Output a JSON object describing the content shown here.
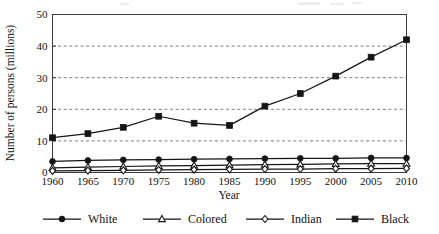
{
  "chart_data": {
    "type": "line",
    "title": "",
    "xlabel": "Year",
    "ylabel": "Number of persons (millions)",
    "x": [
      1960,
      1965,
      1970,
      1975,
      1980,
      1985,
      1990,
      1995,
      2000,
      2005,
      2010
    ],
    "xtick_labels": [
      "1960",
      "1965",
      "1970",
      "1975",
      "1980",
      "1985",
      "1990",
      "1995",
      "2000",
      "2005",
      "2010"
    ],
    "ytick_labels": [
      "0",
      "10",
      "20",
      "30",
      "40",
      "50"
    ],
    "yticks": [
      0,
      10,
      20,
      30,
      40,
      50
    ],
    "ylim": [
      0,
      50
    ],
    "xlim": [
      1960,
      2010
    ],
    "grid": "horizontal-dashed",
    "gridlines": [
      10,
      20,
      30,
      40
    ],
    "legend_position": "bottom",
    "series": [
      {
        "name": "White",
        "marker": "filled-circle",
        "color": "#151515",
        "values": [
          3.5,
          3.8,
          4.0,
          4.1,
          4.2,
          4.3,
          4.4,
          4.5,
          4.5,
          4.6,
          4.6
        ]
      },
      {
        "name": "Colored",
        "marker": "open-triangle",
        "color": "#151515",
        "values": [
          1.5,
          1.7,
          1.9,
          2.1,
          2.2,
          2.3,
          2.5,
          2.6,
          2.7,
          2.8,
          2.8
        ]
      },
      {
        "name": "Indian",
        "marker": "open-diamond",
        "color": "#151515",
        "values": [
          0.5,
          0.6,
          0.7,
          0.8,
          0.9,
          1.0,
          1.1,
          1.1,
          1.2,
          1.25,
          1.3
        ]
      },
      {
        "name": "Black",
        "marker": "filled-square",
        "color": "#151515",
        "values": [
          11.0,
          12.3,
          14.3,
          17.8,
          15.6,
          14.9,
          21.0,
          25.0,
          30.5,
          36.5,
          42.0
        ]
      }
    ]
  },
  "legend": {
    "entries": [
      {
        "label": "White",
        "marker": "filled-circle"
      },
      {
        "label": "Colored",
        "marker": "open-triangle"
      },
      {
        "label": "Indian",
        "marker": "open-diamond"
      },
      {
        "label": "Black",
        "marker": "filled-square"
      }
    ]
  },
  "axes": {
    "y_title": "Number of persons (millions)",
    "x_title": "Year"
  }
}
